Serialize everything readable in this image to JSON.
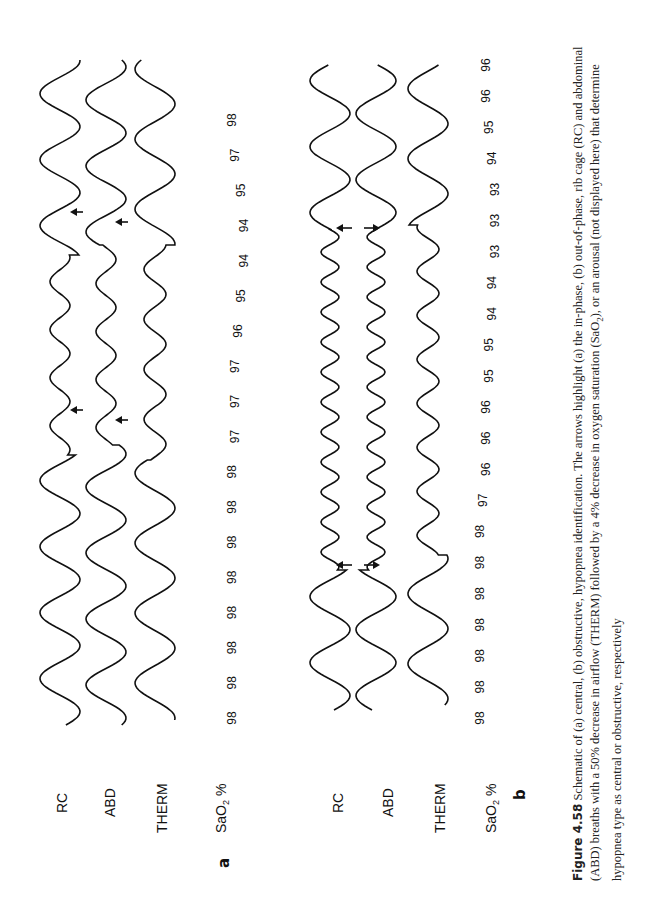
{
  "figure": {
    "number_label": "Figure 4.58",
    "caption_part1": " Schematic of (a) central, (b) obstructive, hypopnea identification.  The arrows highlight (a) the in-phase, (b) out-of-phase, rib cage (RC) and abdominal (ABD) breaths with a 50% decrease in airflow (THERM) followed by a 4% decrease in oxygen saturation (SaO",
    "caption_sub": "2",
    "caption_part2": "), or an arousal (not displayed here) that determine hypopnea type as central or obstructive, respectively"
  },
  "channel_labels": {
    "rc": "RC",
    "abd": "ABD",
    "therm": "THERM",
    "sao2_main": "SaO",
    "sao2_sub": "2",
    "sao2_unit": " %"
  },
  "panels": [
    {
      "letter": "a",
      "type": "central hypopnea",
      "arrow_style": "in-phase",
      "sao2_values": [
        "98",
        "98",
        "98",
        "98",
        "98",
        "98",
        "98",
        "98",
        "97",
        "97",
        "97",
        "96",
        "95",
        "94",
        "94",
        "95",
        "97",
        "98"
      ]
    },
    {
      "letter": "b",
      "type": "obstructive hypopnea",
      "arrow_style": "out-of-phase",
      "sao2_values": [
        "98",
        "98",
        "98",
        "98",
        "98",
        "98",
        "98",
        "97",
        "96",
        "96",
        "96",
        "95",
        "95",
        "94",
        "94",
        "93",
        "93",
        "93",
        "94",
        "95",
        "96",
        "96"
      ]
    }
  ],
  "colors": {
    "ink": "#111111",
    "background": "#ffffff"
  }
}
